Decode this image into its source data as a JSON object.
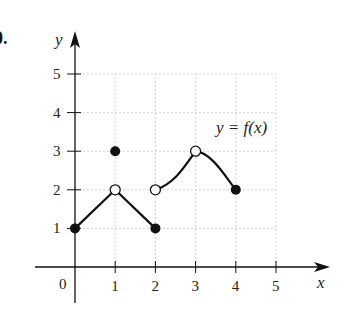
{
  "problem": {
    "number_label": "0."
  },
  "chart_data": {
    "type": "line",
    "title": "",
    "xlabel": "x",
    "ylabel": "y",
    "xlim": [
      0,
      5
    ],
    "ylim": [
      0,
      5
    ],
    "x_ticks": [
      "1",
      "2",
      "3",
      "4",
      "5"
    ],
    "y_ticks": [
      "1",
      "2",
      "3",
      "4",
      "5"
    ],
    "origin_label": "0",
    "grid": true,
    "annotation": "y = f(x)",
    "segments": [
      {
        "name": "segment-1",
        "shape": "line",
        "points": [
          [
            0,
            1
          ],
          [
            1,
            2
          ]
        ]
      },
      {
        "name": "segment-2",
        "shape": "line",
        "points": [
          [
            1,
            2
          ],
          [
            2,
            1
          ]
        ]
      },
      {
        "name": "segment-3",
        "shape": "curve",
        "points": [
          [
            2,
            2
          ],
          [
            3,
            3
          ]
        ]
      },
      {
        "name": "segment-4",
        "shape": "curve",
        "points": [
          [
            3,
            3
          ],
          [
            4,
            2
          ]
        ]
      }
    ],
    "closed_points": [
      [
        0,
        1
      ],
      [
        1,
        3
      ],
      [
        2,
        1
      ],
      [
        4,
        2
      ]
    ],
    "open_points": [
      [
        1,
        2
      ],
      [
        2,
        2
      ],
      [
        3,
        3
      ]
    ]
  },
  "colors": {
    "ink": "#111111",
    "grid": "#c8c8c8",
    "background": "#ffffff"
  }
}
